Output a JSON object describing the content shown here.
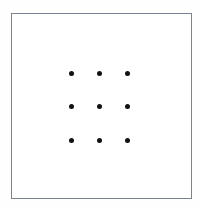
{
  "figure": {
    "title": "",
    "canvas": {
      "width": 202,
      "height": 208,
      "background_color": "#fefefe"
    },
    "frame": {
      "name": "outer-rectangle-border",
      "stroke_color": "#7a8296",
      "stroke_width_px": 1,
      "fill_color": "#ffffff",
      "left": 11,
      "top": 13,
      "width": 181,
      "height": 186
    }
  },
  "chart_data": {
    "type": "scatter",
    "title": "",
    "subtitle": "",
    "xlabel": "",
    "ylabel": "",
    "xlim": [
      0,
      202
    ],
    "ylim": [
      0,
      208
    ],
    "grid": false,
    "legend": null,
    "annotations": [],
    "marker": {
      "shape": "circle",
      "filled": true,
      "color": "#121212",
      "diameter_px": 5
    },
    "layout": {
      "arrangement": "3x3 regular grid",
      "rows": 3,
      "columns": 3,
      "point_count": 9,
      "column_centers_x": [
        71,
        99,
        127
      ],
      "row_centers_y": [
        73,
        106,
        140
      ],
      "column_spacing_px": 28,
      "row_spacing_px": 33
    },
    "points": [
      {
        "label": "r1c1",
        "x": 71,
        "y": 73
      },
      {
        "label": "r1c2",
        "x": 99,
        "y": 73
      },
      {
        "label": "r1c3",
        "x": 127,
        "y": 73
      },
      {
        "label": "r2c1",
        "x": 71,
        "y": 106
      },
      {
        "label": "r2c2",
        "x": 99,
        "y": 106
      },
      {
        "label": "r2c3",
        "x": 127,
        "y": 106
      },
      {
        "label": "r3c1",
        "x": 71,
        "y": 140
      },
      {
        "label": "r3c2",
        "x": 99,
        "y": 140
      },
      {
        "label": "r3c3",
        "x": 127,
        "y": 140
      }
    ]
  }
}
